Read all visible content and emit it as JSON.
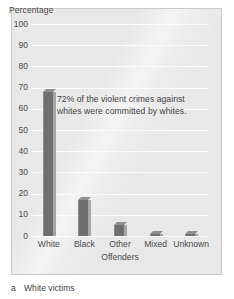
{
  "chart_data": {
    "type": "bar",
    "title": "",
    "categories": [
      "White",
      "Black",
      "Other",
      "Mixed",
      "Unknown"
    ],
    "values": [
      68,
      17,
      5,
      1,
      1
    ],
    "series": [
      {
        "name": "Offenders of violent crimes against white victims",
        "values": [
          68,
          17,
          5,
          1,
          1
        ]
      }
    ],
    "xlabel": "Offenders",
    "ylabel": "Percentage",
    "ylim": [
      0,
      100
    ],
    "yticks": [
      0,
      10,
      20,
      30,
      40,
      50,
      60,
      70,
      80,
      90,
      100
    ],
    "ytick_labels": [
      "0",
      "10",
      "20",
      "30",
      "40",
      "50",
      "60",
      "70",
      "80",
      "90",
      "100"
    ],
    "grid": true,
    "legend": "none",
    "annotations": [
      {
        "text": "72% of the violent crimes against whites were committed by whites.",
        "lines": [
          "72% of the violent crimes against",
          "whites were committed by whites."
        ]
      }
    ],
    "colors": {
      "plot_background": "#e8e8e8",
      "gridline": "#fbfbfb",
      "bar_front": "#6f6f6f",
      "bar_side": "#a6a6a6",
      "bar_top": "#8f8f8f",
      "text": "#4a4a4a",
      "frame_border": "#c9c9c9"
    }
  },
  "caption": {
    "index": "a",
    "text": "White victims"
  }
}
